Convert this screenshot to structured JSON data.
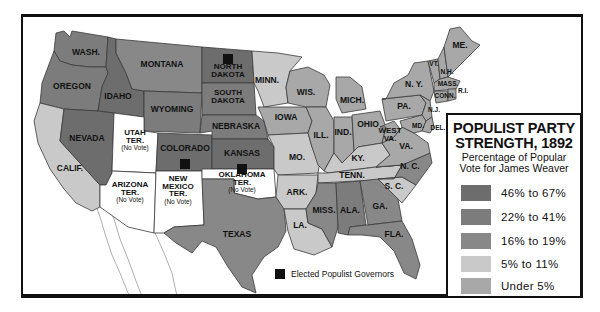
{
  "legend": {
    "title_line1": "POPULIST PARTY",
    "title_line2": "STRENGTH, 1892",
    "subtitle_line1": "Percentage of Popular",
    "subtitle_line2": "Vote for James Weaver",
    "categories": [
      {
        "key": "c1",
        "label": "46% to 67%",
        "color": "#6d6d6d"
      },
      {
        "key": "c2",
        "label": "22% to 41%",
        "color": "#7c7c7c"
      },
      {
        "key": "c3",
        "label": "16% to 19%",
        "color": "#888888"
      },
      {
        "key": "c4",
        "label": "5% to 11%",
        "color": "#c9c9c9"
      },
      {
        "key": "c5",
        "label": "Under 5%",
        "color": "#a8a8a8"
      }
    ]
  },
  "no_vote_color": "#ffffff",
  "governor_key": {
    "label": "Elected Populist Governors",
    "color": "#111111"
  },
  "regions": {
    "wash": {
      "label": [
        "WASH."
      ],
      "category": "c2"
    },
    "oregon": {
      "label": [
        "OREGON"
      ],
      "category": "c2"
    },
    "calif": {
      "label": [
        "CALIF."
      ],
      "category": "c4"
    },
    "idaho": {
      "label": [
        "IDAHO"
      ],
      "category": "c1"
    },
    "nevada": {
      "label": [
        "NEVADA"
      ],
      "category": "c1"
    },
    "montana": {
      "label": [
        "MONTANA"
      ],
      "category": "c3"
    },
    "wyoming": {
      "label": [
        "WYOMING"
      ],
      "category": "c2"
    },
    "utah": {
      "label": [
        "UTAH",
        "TER."
      ],
      "note": "(No Vote)",
      "category": "none"
    },
    "arizona": {
      "label": [
        "ARIZONA",
        "TER."
      ],
      "note": "(No Vote)",
      "category": "none"
    },
    "colorado": {
      "label": [
        "COLORADO"
      ],
      "category": "c1",
      "governor": true
    },
    "newmexico": {
      "label": [
        "NEW",
        "MEXICO",
        "TER."
      ],
      "note": "(No Vote)",
      "category": "none"
    },
    "ndakota": {
      "label": [
        "NORTH",
        "DAKOTA"
      ],
      "category": "c1",
      "governor": true
    },
    "sdakota": {
      "label": [
        "SOUTH",
        "DAKOTA"
      ],
      "category": "c2"
    },
    "nebraska": {
      "label": [
        "NEBRASKA"
      ],
      "category": "c2"
    },
    "kansas": {
      "label": [
        "KANSAS"
      ],
      "category": "c1",
      "governor": true
    },
    "oklahoma": {
      "label": [
        "OKLAHOMA",
        "TER."
      ],
      "note": "(No Vote)",
      "category": "none"
    },
    "texas": {
      "label": [
        "TEXAS"
      ],
      "category": "c3"
    },
    "minn": {
      "label": [
        "MINN."
      ],
      "category": "c4"
    },
    "iowa": {
      "label": [
        "IOWA"
      ],
      "category": "c5"
    },
    "mo": {
      "label": [
        "MO."
      ],
      "category": "c4"
    },
    "ark": {
      "label": [
        "ARK."
      ],
      "category": "c4"
    },
    "la": {
      "label": [
        "LA."
      ],
      "category": "c4"
    },
    "wis": {
      "label": [
        "WIS."
      ],
      "category": "c5"
    },
    "ill": {
      "label": [
        "ILL."
      ],
      "category": "c5"
    },
    "mich": {
      "label": [
        "MICH."
      ],
      "category": "c5"
    },
    "ind": {
      "label": [
        "IND."
      ],
      "category": "c5"
    },
    "ohio": {
      "label": [
        "OHIO"
      ],
      "category": "c5"
    },
    "ky": {
      "label": [
        "KY."
      ],
      "category": "c4"
    },
    "tenn": {
      "label": [
        "TENN."
      ],
      "category": "c4"
    },
    "miss": {
      "label": [
        "MISS."
      ],
      "category": "c3"
    },
    "ala": {
      "label": [
        "ALA."
      ],
      "category": "c2"
    },
    "ga": {
      "label": [
        "GA."
      ],
      "category": "c3"
    },
    "fla": {
      "label": [
        "FLA."
      ],
      "category": "c3"
    },
    "sc": {
      "label": [
        "S. C."
      ],
      "category": "c4"
    },
    "nc": {
      "label": [
        "N. C."
      ],
      "category": "c3"
    },
    "va": {
      "label": [
        "VA."
      ],
      "category": "c5"
    },
    "wva": {
      "label": [
        "WEST",
        "VA."
      ],
      "category": "c5"
    },
    "pa": {
      "label": [
        "PA."
      ],
      "category": "c5"
    },
    "ny": {
      "label": [
        "N. Y."
      ],
      "category": "c5"
    },
    "nj": {
      "label": [
        "N.J."
      ],
      "category": "c5"
    },
    "md": {
      "label": [
        "MD."
      ],
      "category": "c5"
    },
    "del": {
      "label": [
        "DEL."
      ],
      "category": "c5"
    },
    "vt": {
      "label": [
        "VT."
      ],
      "category": "c5"
    },
    "nh": {
      "label": [
        "N.H."
      ],
      "category": "c5"
    },
    "me": {
      "label": [
        "ME."
      ],
      "category": "c5"
    },
    "mass": {
      "label": [
        "MASS."
      ],
      "category": "c5"
    },
    "conn": {
      "label": [
        "CONN."
      ],
      "category": "c5"
    },
    "ri": {
      "label": [
        "R.I."
      ],
      "category": "c5"
    }
  }
}
